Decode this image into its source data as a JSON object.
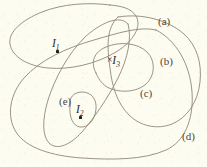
{
  "figure": {
    "background_color": "#fdfcf0",
    "stroke_color": "#8e8778",
    "label_color": "#4a463e",
    "point_color": "#211f1b",
    "width": 207,
    "height": 167
  },
  "curve_labels": [
    {
      "id": "a",
      "text": "(a)",
      "x": 158,
      "y": 16
    },
    {
      "id": "b",
      "text": "(b)",
      "x": 160,
      "y": 56
    },
    {
      "id": "c",
      "text": "(c)",
      "x": 140,
      "y": 88
    },
    {
      "id": "d",
      "text": "(d)",
      "x": 182,
      "y": 131
    },
    {
      "id": "e",
      "text": "(e)",
      "x": 59,
      "y": 96
    }
  ],
  "point_labels": [
    {
      "id": "I1",
      "prefix": "",
      "symbol": "I",
      "subscript": "1",
      "x": 52,
      "y": 38,
      "dot_x": 56,
      "dot_y": 50
    },
    {
      "id": "I2",
      "prefix": "",
      "symbol": "I",
      "subscript": "2",
      "x": 76,
      "y": 104,
      "dot_x": 79,
      "dot_y": 116
    },
    {
      "id": "I3",
      "prefix": "×",
      "symbol": "I",
      "subscript": "3",
      "x": 107,
      "y": 55,
      "dot_x": null,
      "dot_y": null
    }
  ],
  "curves": {
    "a": "M 110 5 C 88 2 62 4 42 12 C 22 20 8 32 10 44 C 12 57 28 66 48 68 C 70 70 96 64 116 52 C 134 41 142 26 136 16 C 131 8 121 6 110 5 Z",
    "b": "M 118 17 C 142 13 168 20 184 34 C 197 46 202 63 200 82 C 198 102 187 118 172 124 C 157 130 140 126 129 115 C 117 103 112 86 110 68 C 107 47 106 28 118 17 Z",
    "c": "M 96 73 C 90 62 94 52 106 47 C 120 41 138 43 147 52 C 156 61 155 76 146 84 C 136 93 118 93 107 87 C 101 83 98 78 96 73 Z",
    "d": "M 156 30 C 176 40 190 64 192 92 C 194 120 184 142 166 150 C 144 160 112 160 82 158 C 52 156 26 148 16 132 C 6 116 10 94 24 78 C 40 60 66 48 94 40 C 118 33 140 26 156 30 Z",
    "e": "M 128 24 C 132 38 128 58 118 78 C 108 98 94 118 82 132 C 70 145 58 150 50 144 C 42 137 42 120 48 100 C 55 78 68 54 84 38 C 100 23 120 14 128 24 Z",
    "e_inner": "M 70 106 C 68 98 74 92 82 92 C 91 92 97 99 96 109 C 95 120 88 128 80 127 C 73 126 69 117 70 106 Z"
  }
}
